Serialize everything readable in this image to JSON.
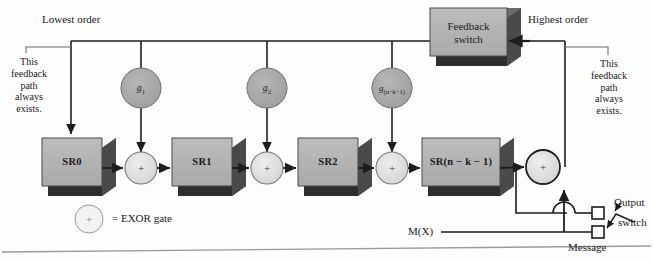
{
  "figure": {
    "type": "block-diagram"
  },
  "annotations": {
    "lowest_order": "Lowest order",
    "highest_order": "Highest order",
    "feedback_note_left": "This\nfeedback\npath\nalways\nexists.",
    "feedback_note_left_lines": [
      "This",
      "feedback",
      "path",
      "always",
      "exists."
    ],
    "feedback_note_right_lines": [
      "This",
      "feedback",
      "path",
      "always",
      "exists."
    ],
    "output_switch_line1": "Output",
    "output_switch_line2": "switch",
    "message_label": "Message",
    "input_label": "M(X)"
  },
  "feedback_switch": {
    "line1": "Feedback",
    "line2": "switch"
  },
  "legend": {
    "symbol": "+",
    "text": "= EXOR gate"
  },
  "shift_registers": [
    {
      "id": "sr0",
      "label": "SR0"
    },
    {
      "id": "sr1",
      "label": "SR1"
    },
    {
      "id": "sr2",
      "label": "SR2"
    },
    {
      "id": "srn",
      "label": "SR(n − k − 1)"
    }
  ],
  "tap_gains": [
    {
      "id": "g1",
      "base": "g",
      "sub": "1"
    },
    {
      "id": "g2",
      "base": "g",
      "sub": "2"
    },
    {
      "id": "gn",
      "base": "g",
      "sub": "(n−k−1)"
    }
  ],
  "exor_gates": [
    {
      "id": "xor1",
      "symbol": "+"
    },
    {
      "id": "xor2",
      "symbol": "+"
    },
    {
      "id": "xor3",
      "symbol": "+"
    },
    {
      "id": "xor_out",
      "symbol": "+"
    }
  ],
  "switch_contacts": [
    {
      "id": "output-contact"
    },
    {
      "id": "message-contact"
    }
  ],
  "colors": {
    "block_face": "#b3b3b3",
    "block_shadow": "#2e2e2e",
    "block_side": "#585858",
    "gain_circle": "#a8a8a8",
    "exor_circle": "#dedede",
    "wire": "#1d1d1d",
    "leader": "#6a6a6a",
    "rule": "#9b9b9b",
    "text": "#1a1a1a"
  }
}
